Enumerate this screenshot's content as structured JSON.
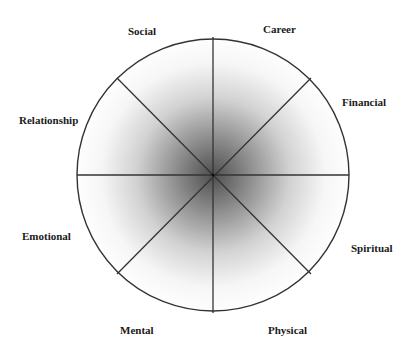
{
  "diagram": {
    "type": "wheel-of-life",
    "center": {
      "x": 213,
      "y": 175
    },
    "radius": 136,
    "divisions": 8,
    "stroke_color": "#333333",
    "shading": {
      "center_color": "#5a5a5a",
      "edge_color": "#ffffff"
    },
    "segments": [
      {
        "id": "career",
        "label": "Career",
        "x": 263,
        "y": 24
      },
      {
        "id": "financial",
        "label": "Financial",
        "x": 342,
        "y": 96
      },
      {
        "id": "spiritual",
        "label": "Spiritual",
        "x": 351,
        "y": 242
      },
      {
        "id": "physical",
        "label": "Physical",
        "x": 268,
        "y": 324
      },
      {
        "id": "mental",
        "label": "Mental",
        "x": 120,
        "y": 324
      },
      {
        "id": "emotional",
        "label": "Emotional",
        "x": 22,
        "y": 230
      },
      {
        "id": "relationship",
        "label": "Relationship",
        "x": 19,
        "y": 114
      },
      {
        "id": "social",
        "label": "Social",
        "x": 128,
        "y": 25
      }
    ]
  }
}
